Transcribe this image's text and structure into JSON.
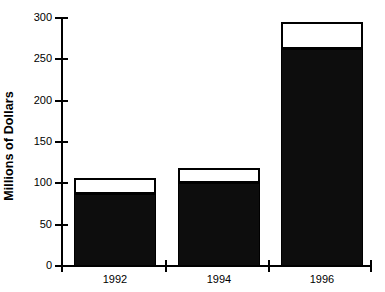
{
  "chart_data": {
    "type": "bar",
    "subtype": "stacked-bar",
    "title": "",
    "xlabel": "",
    "ylabel": "Millions of Dollars",
    "categories": [
      "1992",
      "1994",
      "1996"
    ],
    "series": [
      {
        "name": "lower-segment",
        "color": "#000000",
        "values": [
          87,
          101,
          262
        ]
      },
      {
        "name": "upper-segment",
        "color": "#ffffff",
        "values": [
          19,
          18,
          33
        ]
      }
    ],
    "totals": [
      106,
      119,
      295
    ],
    "ylim": [
      0,
      300
    ],
    "yticks": [
      0,
      50,
      100,
      150,
      200,
      250,
      300
    ],
    "ytick_labels": [
      "0",
      "50",
      "100",
      "150",
      "200",
      "250",
      "300"
    ],
    "grid": false,
    "legend": "none"
  },
  "axes": {
    "y_title": "Millions of Dollars"
  },
  "clipped_caption": ""
}
